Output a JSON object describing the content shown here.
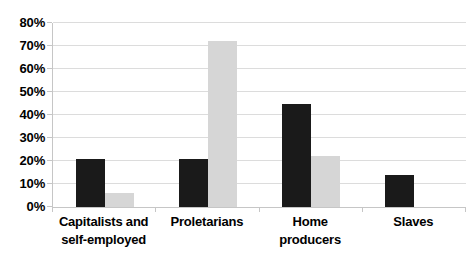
{
  "colors": {
    "background": "#ffffff",
    "gridline": "#dcdcdc",
    "axis": "#c6c6c6",
    "text": "#000000",
    "bar_black": "#1a1a1a",
    "bar_gray": "#d6d6d6"
  },
  "chart_data": {
    "type": "bar",
    "title": "",
    "xlabel": "",
    "ylabel": "",
    "categories": [
      "Capitalists and self-employed",
      "Proletarians",
      "Home producers",
      "Slaves"
    ],
    "series": [
      {
        "name": "black-series",
        "color": "#1a1a1a",
        "values": [
          21,
          21,
          45,
          14
        ]
      },
      {
        "name": "gray-series",
        "color": "#d6d6d6",
        "values": [
          6,
          72,
          22,
          0
        ]
      }
    ],
    "ylim": [
      0,
      80
    ],
    "ytick_step": 10,
    "ytick_labels": [
      "0%",
      "10%",
      "20%",
      "30%",
      "40%",
      "50%",
      "60%",
      "70%",
      "80%"
    ],
    "grid": true,
    "legend": false
  }
}
